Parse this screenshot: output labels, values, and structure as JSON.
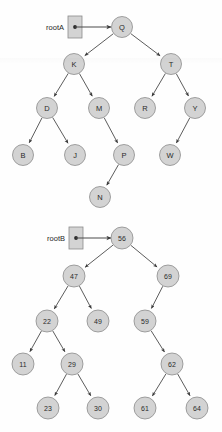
{
  "figure": {
    "caption": "",
    "background_color": "#fefefe",
    "node_fill": "#d3d3d3",
    "node_stroke": "#8c8c8c",
    "edge_color": "#4a4a4a",
    "text_color": "#2a2a2a"
  },
  "trees": [
    {
      "id": "tree-a",
      "root_label": "rootA",
      "root_box": {
        "x": 68,
        "y": 16,
        "w": 14,
        "h": 22,
        "dot_x": 75,
        "dot_y": 27
      },
      "pointer": {
        "x1": 75,
        "y1": 27,
        "x2": 111,
        "y2": 27
      },
      "node_radius": 10.5,
      "label_style": "alpha",
      "nodes": [
        {
          "name": "Q",
          "label": "Q",
          "x": 122,
          "y": 27
        },
        {
          "name": "K",
          "label": "K",
          "x": 74,
          "y": 64
        },
        {
          "name": "T",
          "label": "T",
          "x": 171,
          "y": 64
        },
        {
          "name": "D",
          "label": "D",
          "x": 47,
          "y": 108
        },
        {
          "name": "M",
          "label": "M",
          "x": 99,
          "y": 108
        },
        {
          "name": "R",
          "label": "R",
          "x": 145,
          "y": 108
        },
        {
          "name": "Y",
          "label": "Y",
          "x": 195,
          "y": 108
        },
        {
          "name": "B",
          "label": "B",
          "x": 23,
          "y": 155
        },
        {
          "name": "J",
          "label": "J",
          "x": 75,
          "y": 155
        },
        {
          "name": "P",
          "label": "P",
          "x": 124,
          "y": 155
        },
        {
          "name": "W",
          "label": "W",
          "x": 170,
          "y": 155
        },
        {
          "name": "N",
          "label": "N",
          "x": 100,
          "y": 197
        }
      ],
      "edges": [
        {
          "from": "Q",
          "to": "K"
        },
        {
          "from": "Q",
          "to": "T"
        },
        {
          "from": "K",
          "to": "D"
        },
        {
          "from": "K",
          "to": "M"
        },
        {
          "from": "T",
          "to": "R"
        },
        {
          "from": "T",
          "to": "Y"
        },
        {
          "from": "D",
          "to": "B"
        },
        {
          "from": "D",
          "to": "J"
        },
        {
          "from": "M",
          "to": "P"
        },
        {
          "from": "Y",
          "to": "W"
        },
        {
          "from": "P",
          "to": "N"
        }
      ]
    },
    {
      "id": "tree-b",
      "root_label": "rootB",
      "root_box": {
        "x": 69,
        "y": 227,
        "w": 14,
        "h": 22,
        "dot_x": 76,
        "dot_y": 238
      },
      "pointer": {
        "x1": 76,
        "y1": 238,
        "x2": 111,
        "y2": 238
      },
      "node_radius": 11,
      "label_style": "num",
      "nodes": [
        {
          "name": "56",
          "label": "56",
          "x": 122,
          "y": 238
        },
        {
          "name": "47",
          "label": "47",
          "x": 74,
          "y": 276
        },
        {
          "name": "69",
          "label": "69",
          "x": 168,
          "y": 276
        },
        {
          "name": "22",
          "label": "22",
          "x": 47,
          "y": 321
        },
        {
          "name": "49",
          "label": "49",
          "x": 98,
          "y": 321
        },
        {
          "name": "59",
          "label": "59",
          "x": 145,
          "y": 321
        },
        {
          "name": "11",
          "label": "11",
          "x": 23,
          "y": 364
        },
        {
          "name": "29",
          "label": "29",
          "x": 72,
          "y": 364
        },
        {
          "name": "62",
          "label": "62",
          "x": 172,
          "y": 364
        },
        {
          "name": "23",
          "label": "23",
          "x": 48,
          "y": 408
        },
        {
          "name": "30",
          "label": "30",
          "x": 98,
          "y": 408
        },
        {
          "name": "61",
          "label": "61",
          "x": 145,
          "y": 408
        },
        {
          "name": "64",
          "label": "64",
          "x": 197,
          "y": 408
        }
      ],
      "edges": [
        {
          "from": "56",
          "to": "47"
        },
        {
          "from": "56",
          "to": "69"
        },
        {
          "from": "47",
          "to": "22"
        },
        {
          "from": "47",
          "to": "49"
        },
        {
          "from": "69",
          "to": "59"
        },
        {
          "from": "22",
          "to": "11"
        },
        {
          "from": "22",
          "to": "29"
        },
        {
          "from": "59",
          "to": "62"
        },
        {
          "from": "29",
          "to": "23"
        },
        {
          "from": "29",
          "to": "30"
        },
        {
          "from": "62",
          "to": "61"
        },
        {
          "from": "62",
          "to": "64"
        }
      ]
    }
  ]
}
